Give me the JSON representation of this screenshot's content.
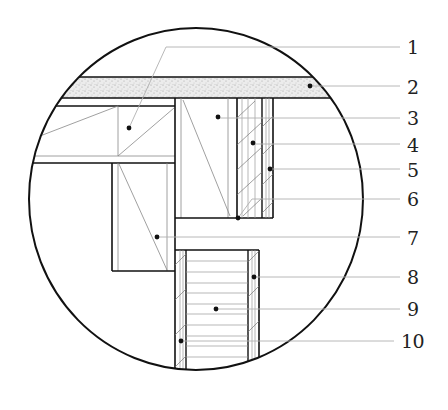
{
  "diagram": {
    "type": "construction-detail-callout",
    "colors": {
      "line_heavy": "#111111",
      "line_light": "#9a9a9a",
      "leader": "#b0b0b0",
      "slab_fill": "#e6e6e6",
      "dot": "#111111",
      "label": "#222222"
    },
    "labels": [
      {
        "id": "1",
        "text": "1",
        "y": 43
      },
      {
        "id": "2",
        "text": "2",
        "y": 87
      },
      {
        "id": "3",
        "text": "3",
        "y": 118
      },
      {
        "id": "4",
        "text": "4",
        "y": 144
      },
      {
        "id": "5",
        "text": "5",
        "y": 169
      },
      {
        "id": "6",
        "text": "6",
        "y": 199
      },
      {
        "id": "7",
        "text": "7",
        "y": 238
      },
      {
        "id": "8",
        "text": "8",
        "y": 277
      },
      {
        "id": "9",
        "text": "9",
        "y": 309
      },
      {
        "id": "10",
        "text": "10",
        "y": 341
      }
    ]
  }
}
